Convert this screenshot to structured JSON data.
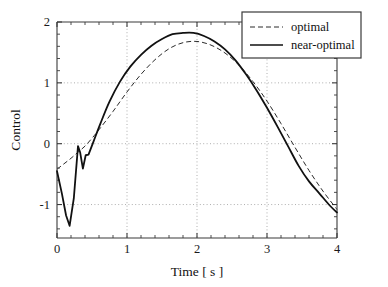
{
  "chart_data": {
    "type": "line",
    "title": "",
    "xlabel": "Time  [ s ]",
    "ylabel": "Control",
    "xlim": [
      0,
      4
    ],
    "ylim": [
      -1.55,
      2
    ],
    "xticks": [
      0,
      1,
      2,
      3,
      4
    ],
    "xtick_labels": [
      "0",
      "1",
      "2",
      "3",
      "4"
    ],
    "yticks": [
      -1,
      0,
      1,
      2
    ],
    "ytick_labels": [
      "-1",
      "0",
      "1",
      "2"
    ],
    "xtick_minor_step": 0.2,
    "ytick_minor_step": 0.2,
    "grid": true,
    "grid_style": "dotted",
    "legend_position": "top-right",
    "series": [
      {
        "name": "optimal",
        "style": "dashed",
        "color": "#2b2b2b",
        "x": [
          0.0,
          0.1,
          0.2,
          0.3,
          0.4,
          0.5,
          0.6,
          0.8,
          1.0,
          1.2,
          1.4,
          1.6,
          1.8,
          2.0,
          2.2,
          2.4,
          2.6,
          2.8,
          3.0,
          3.2,
          3.4,
          3.6,
          3.8,
          4.0
        ],
        "y": [
          -0.42,
          -0.33,
          -0.24,
          -0.14,
          -0.04,
          0.09,
          0.23,
          0.53,
          0.85,
          1.14,
          1.38,
          1.56,
          1.66,
          1.68,
          1.62,
          1.49,
          1.29,
          1.02,
          0.7,
          0.33,
          -0.06,
          -0.44,
          -0.78,
          -1.08
        ]
      },
      {
        "name": "near-optimal",
        "style": "solid",
        "color": "#111111",
        "x": [
          0.0,
          0.07,
          0.13,
          0.18,
          0.24,
          0.3,
          0.33,
          0.37,
          0.41,
          0.45,
          0.52,
          0.62,
          0.75,
          0.9,
          1.05,
          1.2,
          1.35,
          1.5,
          1.65,
          1.8,
          1.95,
          2.1,
          2.25,
          2.4,
          2.55,
          2.7,
          2.85,
          3.0,
          3.15,
          3.3,
          3.45,
          3.6,
          3.75,
          3.9,
          4.0
        ],
        "y": [
          -0.45,
          -0.82,
          -1.18,
          -1.35,
          -0.9,
          -0.04,
          -0.14,
          -0.41,
          -0.19,
          -0.18,
          0.03,
          0.33,
          0.69,
          1.02,
          1.27,
          1.46,
          1.61,
          1.72,
          1.8,
          1.82,
          1.82,
          1.77,
          1.68,
          1.55,
          1.37,
          1.14,
          0.88,
          0.59,
          0.28,
          -0.04,
          -0.36,
          -0.62,
          -0.82,
          -1.02,
          -1.13
        ]
      }
    ],
    "annotations": []
  },
  "legend": {
    "entries": [
      {
        "label": "optimal",
        "style": "dashed"
      },
      {
        "label": "near-optimal",
        "style": "solid"
      }
    ]
  }
}
